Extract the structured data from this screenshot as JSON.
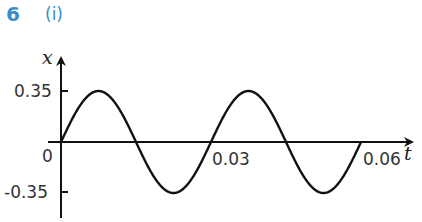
{
  "question": {
    "number": "6",
    "part": "(i)"
  },
  "chart_data": {
    "type": "line",
    "title": "",
    "xlabel": "t",
    "ylabel": "x",
    "xlim": [
      0,
      0.06
    ],
    "ylim": [
      -0.35,
      0.35
    ],
    "x_ticks": [
      "0",
      "0.03",
      "0.06"
    ],
    "y_ticks": [
      "0.35",
      "-0.35"
    ],
    "origin_label": "0",
    "grid": false,
    "series": [
      {
        "name": "x = 0.35 sin(2πt/0.03)",
        "amplitude": 0.35,
        "period": 0.03,
        "x": [
          0,
          0.0075,
          0.015,
          0.0225,
          0.03,
          0.0375,
          0.045,
          0.0525,
          0.06
        ],
        "values": [
          0,
          0.35,
          0,
          -0.35,
          0,
          0.35,
          0,
          -0.35,
          0
        ]
      }
    ]
  },
  "colors": {
    "accent": "#3a8cc8",
    "curve": "#111111"
  }
}
